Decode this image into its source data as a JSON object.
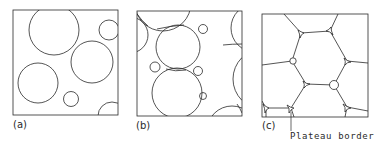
{
  "figure": {
    "panels": [
      {
        "id": "a",
        "label": "(a)",
        "description": "Dispersed spherical bubbles (wet foam)"
      },
      {
        "id": "b",
        "label": "(b)",
        "description": "Closely packed spherical bubbles"
      },
      {
        "id": "c",
        "label": "(c)",
        "description": "Polyhedral bubbles (dry foam)"
      }
    ],
    "annotation": "Plateau border",
    "colors": {
      "stroke": "#2a2a2a",
      "background": "#ffffff"
    }
  }
}
